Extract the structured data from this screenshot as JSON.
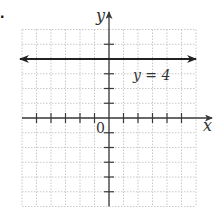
{
  "problem": {
    "number_visible": "."
  },
  "chart_data": {
    "type": "line",
    "title": "",
    "xlabel": "x",
    "ylabel": "y",
    "xlim": [
      -6,
      6
    ],
    "ylim": [
      -6,
      6
    ],
    "grid": true,
    "grid_style": "dotted",
    "x_ticks": [
      -5,
      -4,
      -3,
      -2,
      -1,
      1,
      2,
      3,
      4,
      5
    ],
    "y_ticks": [
      -5,
      -4,
      -3,
      -2,
      -1,
      1,
      2,
      3,
      5
    ],
    "origin_label": "0",
    "series": [
      {
        "name": "y = 4",
        "kind": "horizontal-line",
        "x": [
          -6,
          6
        ],
        "y": [
          4,
          4
        ],
        "arrows": "both"
      }
    ],
    "annotations": [
      {
        "text": "y = 4",
        "x": 2.9,
        "y": 3.1
      }
    ],
    "legend": "none"
  },
  "colors": {
    "axis": "#3a3a3a",
    "line": "#222222",
    "grid": "#c8c8c8",
    "text": "#333333"
  }
}
